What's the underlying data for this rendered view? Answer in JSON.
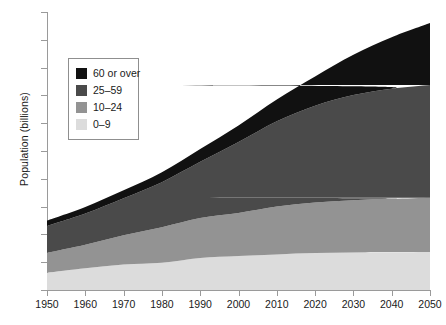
{
  "chart_data": {
    "type": "area",
    "title": "",
    "xlabel": "",
    "ylabel": "Population (billions)",
    "stacked": true,
    "grid": false,
    "legend_position": "upper-left-inside",
    "xlim": [
      1950,
      2050
    ],
    "ylim": [
      0,
      10
    ],
    "x": [
      1950,
      1960,
      1970,
      1980,
      1990,
      2000,
      2010,
      2020,
      2030,
      2040,
      2050
    ],
    "x_tick_labels": [
      "1950",
      "1960",
      "1970",
      "1980",
      "1990",
      "2000",
      "2010",
      "2020",
      "2030",
      "2040",
      "2050"
    ],
    "y_tick_labels": [
      "0",
      "1",
      "2",
      "3",
      "4",
      "5",
      "6",
      "7",
      "8",
      "9",
      "10"
    ],
    "y_ticks": [
      0,
      1,
      2,
      3,
      4,
      5,
      6,
      7,
      8,
      9,
      10
    ],
    "series": [
      {
        "name": "0–9",
        "color": "#dcdcdc",
        "values": [
          0.62,
          0.78,
          0.92,
          0.98,
          1.15,
          1.22,
          1.28,
          1.33,
          1.35,
          1.36,
          1.37
        ]
      },
      {
        "name": "10–24",
        "color": "#939393",
        "values": [
          0.72,
          0.85,
          1.05,
          1.28,
          1.44,
          1.55,
          1.72,
          1.82,
          1.88,
          1.92,
          1.95
        ]
      },
      {
        "name": "25–59",
        "color": "#4a4a4a",
        "values": [
          0.96,
          1.12,
          1.33,
          1.62,
          2.02,
          2.55,
          3.07,
          3.48,
          3.78,
          3.96,
          4.05
        ]
      },
      {
        "name": "60 or over",
        "color": "#111111",
        "values": [
          0.2,
          0.24,
          0.29,
          0.36,
          0.46,
          0.6,
          0.78,
          1.05,
          1.45,
          1.85,
          2.23
        ]
      }
    ],
    "totals": [
      2.5,
      2.99,
      3.59,
      4.24,
      5.07,
      5.92,
      6.85,
      7.68,
      8.46,
      9.09,
      9.6
    ],
    "legend_order": [
      "60 or over",
      "25–59",
      "10–24",
      "0–9"
    ]
  },
  "legend": {
    "items": [
      {
        "label": "60 or over",
        "color": "#111111"
      },
      {
        "label": "25–59",
        "color": "#4a4a4a"
      },
      {
        "label": "10–24",
        "color": "#939393"
      },
      {
        "label": "0–9",
        "color": "#dcdcdc"
      }
    ]
  },
  "axes": {
    "y_title": "Population (billions)"
  }
}
